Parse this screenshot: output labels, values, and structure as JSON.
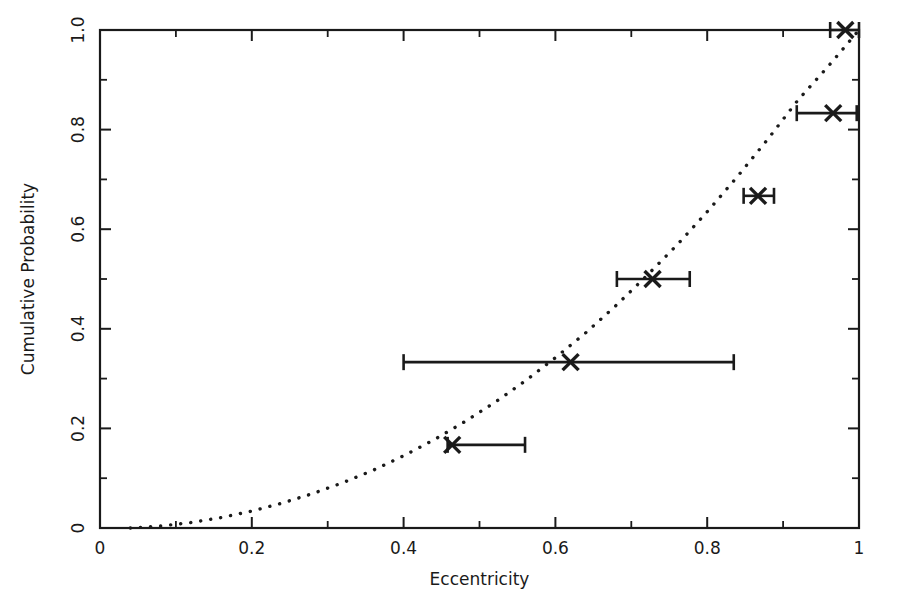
{
  "chart_data": {
    "type": "scatter",
    "title": "",
    "xlabel": "Eccentricity",
    "ylabel": "Cumulative Probability",
    "xlim": [
      0,
      1
    ],
    "ylim": [
      0,
      1
    ],
    "grid": false,
    "legend": "none",
    "x_ticks": [
      {
        "value": 0,
        "label": "0"
      },
      {
        "value": 0.2,
        "label": "0.2"
      },
      {
        "value": 0.4,
        "label": "0.4"
      },
      {
        "value": 0.6,
        "label": "0.6"
      },
      {
        "value": 0.8,
        "label": "0.8"
      },
      {
        "value": 1,
        "label": "1"
      }
    ],
    "x_minor_ticks": [
      0.1,
      0.3,
      0.5,
      0.7,
      0.9
    ],
    "y_ticks": [
      {
        "value": 0,
        "label": "0"
      },
      {
        "value": 0.2,
        "label": "0.2"
      },
      {
        "value": 0.4,
        "label": "0.4"
      },
      {
        "value": 0.6,
        "label": "0.6"
      },
      {
        "value": 0.8,
        "label": "0.8"
      },
      {
        "value": 1,
        "label": "1.0"
      }
    ],
    "y_minor_ticks": [
      0.1,
      0.3,
      0.5,
      0.7,
      0.9
    ],
    "series": [
      {
        "name": "Observed cumulative distribution",
        "type": "scatter",
        "marker": "x",
        "points": [
          {
            "x": 0.464,
            "y": 0.167,
            "x_err_low": 0.458,
            "x_err_high": 0.56
          },
          {
            "x": 0.62,
            "y": 0.333,
            "x_err_low": 0.4,
            "x_err_high": 0.835
          },
          {
            "x": 0.728,
            "y": 0.5,
            "x_err_low": 0.681,
            "x_err_high": 0.777
          },
          {
            "x": 0.867,
            "y": 0.667,
            "x_err_low": 0.848,
            "x_err_high": 0.888
          },
          {
            "x": 0.966,
            "y": 0.833,
            "x_err_low": 0.918,
            "x_err_high": 0.997
          },
          {
            "x": 0.982,
            "y": 1.0,
            "x_err_low": 0.962,
            "x_err_high": 1.0
          }
        ]
      },
      {
        "name": "Model cumulative distribution",
        "type": "line",
        "style": "dotted",
        "points": [
          {
            "x": 0.04,
            "y": 0.0
          },
          {
            "x": 0.08,
            "y": 0.004
          },
          {
            "x": 0.12,
            "y": 0.011
          },
          {
            "x": 0.16,
            "y": 0.021
          },
          {
            "x": 0.2,
            "y": 0.034
          },
          {
            "x": 0.24,
            "y": 0.05
          },
          {
            "x": 0.28,
            "y": 0.069
          },
          {
            "x": 0.32,
            "y": 0.091
          },
          {
            "x": 0.36,
            "y": 0.116
          },
          {
            "x": 0.4,
            "y": 0.145
          },
          {
            "x": 0.44,
            "y": 0.177
          },
          {
            "x": 0.48,
            "y": 0.213
          },
          {
            "x": 0.52,
            "y": 0.252
          },
          {
            "x": 0.56,
            "y": 0.295
          },
          {
            "x": 0.6,
            "y": 0.342
          },
          {
            "x": 0.64,
            "y": 0.392
          },
          {
            "x": 0.68,
            "y": 0.447
          },
          {
            "x": 0.72,
            "y": 0.506
          },
          {
            "x": 0.76,
            "y": 0.568
          },
          {
            "x": 0.8,
            "y": 0.635
          },
          {
            "x": 0.84,
            "y": 0.706
          },
          {
            "x": 0.88,
            "y": 0.781
          },
          {
            "x": 0.92,
            "y": 0.86
          },
          {
            "x": 0.96,
            "y": 0.928
          },
          {
            "x": 1.0,
            "y": 1.0
          }
        ]
      }
    ]
  },
  "colors": {
    "ink": "#1a1a1a",
    "background": "#ffffff"
  }
}
